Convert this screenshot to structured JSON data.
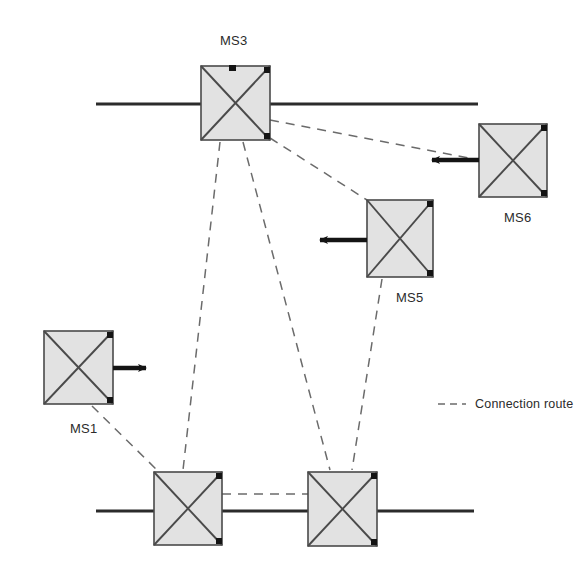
{
  "figure": {
    "type": "network-topology-diagram",
    "background_color": "#ffffff",
    "line_color": "#2b2b2b",
    "node_fill_color": "#e2e2e2",
    "node_stroke_color": "#4a4a4a",
    "dashed_color": "#6b6b6b",
    "arrow_color": "#141414"
  },
  "nodes": [
    {
      "id": "ms3",
      "label": "MS3",
      "x": 201,
      "y": 66,
      "w": 69,
      "h": 74,
      "label_x": 220,
      "label_y": 33
    },
    {
      "id": "ms6",
      "label": "MS6",
      "x": 479,
      "y": 124,
      "w": 68,
      "h": 73,
      "label_x": 504,
      "label_y": 210
    },
    {
      "id": "ms5",
      "label": "MS5",
      "x": 367,
      "y": 200,
      "w": 66,
      "h": 77,
      "label_x": 396,
      "label_y": 290
    },
    {
      "id": "ms1",
      "label": "MS1",
      "x": 44,
      "y": 331,
      "w": 69,
      "h": 73,
      "label_x": 70,
      "label_y": 421
    },
    {
      "id": "ms-bottom-left",
      "label": "",
      "x": 154,
      "y": 472,
      "w": 68,
      "h": 73,
      "label_x": 0,
      "label_y": 0
    },
    {
      "id": "ms-bottom-right",
      "label": "",
      "x": 308,
      "y": 472,
      "w": 69,
      "h": 74,
      "label_x": 0,
      "label_y": 0
    }
  ],
  "bus_lines": [
    {
      "id": "top-bus",
      "x1": 96,
      "y1": 104,
      "x2": 478,
      "y2": 104
    },
    {
      "id": "bottom-bus",
      "x1": 96,
      "y1": 511,
      "x2": 474,
      "y2": 511
    }
  ],
  "connection_routes": [
    {
      "id": "ms3-to-ms6",
      "x1": 270,
      "y1": 120,
      "x2": 479,
      "y2": 160
    },
    {
      "id": "ms3-to-ms5",
      "x1": 270,
      "y1": 138,
      "x2": 367,
      "y2": 200
    },
    {
      "id": "ms3-to-bottom-left",
      "x1": 220,
      "y1": 142,
      "x2": 183,
      "y2": 470
    },
    {
      "id": "ms3-to-bottom-right",
      "x1": 243,
      "y1": 142,
      "x2": 330,
      "y2": 470
    },
    {
      "id": "ms5-to-bottom-right",
      "x1": 382,
      "y1": 279,
      "x2": 352,
      "y2": 470
    },
    {
      "id": "ms1-to-bottom-left",
      "x1": 92,
      "y1": 406,
      "x2": 157,
      "y2": 470
    },
    {
      "id": "bottom-left-to-bottom-right",
      "x1": 222,
      "y1": 494,
      "x2": 308,
      "y2": 494
    }
  ],
  "arrows": [
    {
      "id": "ms1-output-arrow",
      "x1": 113,
      "y1": 368,
      "x2": 146,
      "y2": 368,
      "direction": "right"
    },
    {
      "id": "ms5-input-arrow",
      "x1": 367,
      "y1": 240,
      "x2": 320,
      "y2": 240,
      "direction": "left"
    },
    {
      "id": "ms6-input-arrow",
      "x1": 479,
      "y1": 160,
      "x2": 432,
      "y2": 160,
      "direction": "left"
    }
  ],
  "legend": {
    "label": "Connection route",
    "sample_x1": 438,
    "sample_x2": 466,
    "sample_y": 404,
    "label_x": 475,
    "label_y": 397
  }
}
